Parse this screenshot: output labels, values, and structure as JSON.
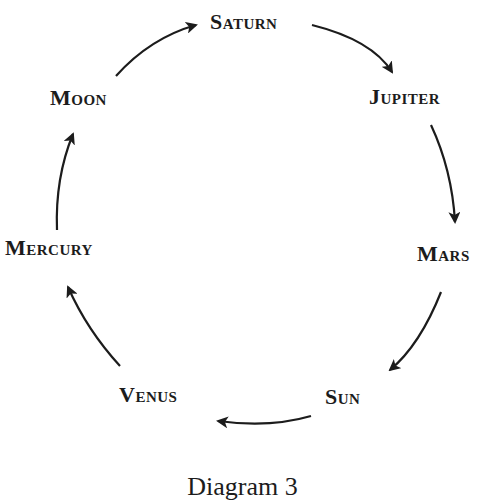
{
  "diagram": {
    "type": "cycle",
    "direction": "clockwise",
    "nodes": [
      {
        "id": "saturn",
        "label": "Saturn"
      },
      {
        "id": "jupiter",
        "label": "Jupiter"
      },
      {
        "id": "mars",
        "label": "Mars"
      },
      {
        "id": "sun",
        "label": "Sun"
      },
      {
        "id": "venus",
        "label": "Venus"
      },
      {
        "id": "mercury",
        "label": "Mercury"
      },
      {
        "id": "moon",
        "label": "Moon"
      }
    ],
    "edges": [
      {
        "from": "Saturn",
        "to": "Jupiter"
      },
      {
        "from": "Jupiter",
        "to": "Mars"
      },
      {
        "from": "Mars",
        "to": "Sun"
      },
      {
        "from": "Sun",
        "to": "Venus"
      },
      {
        "from": "Venus",
        "to": "Mercury"
      },
      {
        "from": "Mercury",
        "to": "Moon"
      },
      {
        "from": "Moon",
        "to": "Saturn"
      }
    ],
    "caption": "Diagram 3"
  },
  "colors": {
    "ink": "#1c1c1c",
    "background": "#ffffff"
  }
}
